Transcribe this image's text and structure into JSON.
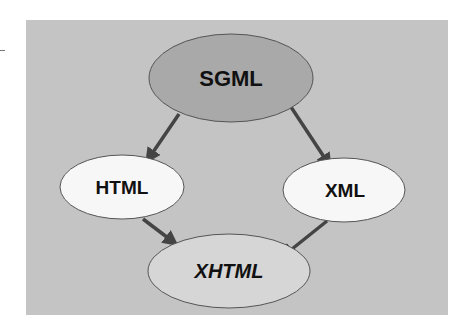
{
  "diagram": {
    "type": "hierarchy",
    "background": "#c4c4c4",
    "nodes": [
      {
        "id": "sgml",
        "label": "SGML",
        "fill": "#a9a9a9",
        "italic": false
      },
      {
        "id": "html",
        "label": "HTML",
        "fill": "#f7f7f7",
        "italic": false
      },
      {
        "id": "xml",
        "label": "XML",
        "fill": "#f7f7f7",
        "italic": false
      },
      {
        "id": "xhtml",
        "label": "XHTML",
        "fill": "#d6d6d6",
        "italic": true
      }
    ],
    "edges": [
      {
        "from": "SGML",
        "to": "HTML"
      },
      {
        "from": "SGML",
        "to": "XML"
      },
      {
        "from": "HTML",
        "to": "XHTML"
      },
      {
        "from": "XML",
        "to": "XHTML"
      }
    ],
    "edge_color": "#444444"
  }
}
